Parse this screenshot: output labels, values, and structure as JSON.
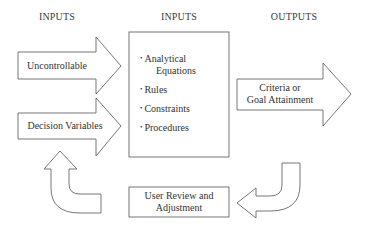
{
  "headers": {
    "left": "INPUTS",
    "center": "INPUTS",
    "right": "OUTPUTS"
  },
  "input_arrows": [
    {
      "label": "Uncontrollable"
    },
    {
      "label": "Decision Variables"
    }
  ],
  "model_box": {
    "items": [
      {
        "line1": "Analytical",
        "line2": "Equations"
      },
      {
        "line1": "Rules",
        "line2": ""
      },
      {
        "line1": "Constraints",
        "line2": ""
      },
      {
        "line1": "Procedures",
        "line2": ""
      }
    ],
    "bullet": "•"
  },
  "output_arrow": {
    "line1": "Criteria or",
    "line2": "Goal Attainment"
  },
  "review_box": {
    "line1": "User Review and",
    "line2": "Adjustment"
  },
  "colors": {
    "stroke": "#555555",
    "text": "#333333",
    "background": "#ffffff"
  }
}
